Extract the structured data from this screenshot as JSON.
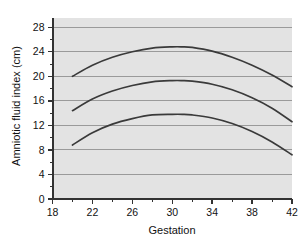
{
  "chart_data": {
    "type": "line",
    "title": "",
    "xlabel": "Gestation",
    "ylabel": "Amniotic fluid index (cm)",
    "xlim": [
      18,
      42
    ],
    "ylim": [
      0,
      29.5
    ],
    "xticks": [
      18,
      22,
      26,
      30,
      34,
      38,
      42
    ],
    "yticks": [
      0,
      4,
      8,
      12,
      16,
      20,
      24,
      28
    ],
    "xminor_step": 2,
    "yminor_step": 2,
    "grid": "horizontal",
    "legend": "none",
    "plot_background": "#e3e3e3",
    "gridline_color": "#9a9a9a",
    "line_color": "#3a3a3a",
    "axis_color": "#333333",
    "series": [
      {
        "name": "upper-percentile",
        "x": [
          20,
          22,
          24,
          26,
          28,
          30,
          31,
          32,
          34,
          36,
          38,
          40,
          42
        ],
        "values": [
          20.0,
          21.8,
          23.1,
          24.0,
          24.6,
          24.8,
          24.8,
          24.7,
          24.1,
          23.1,
          21.8,
          20.2,
          18.3
        ]
      },
      {
        "name": "median-percentile",
        "x": [
          20,
          22,
          24,
          26,
          28,
          30,
          31,
          32,
          34,
          36,
          38,
          40,
          42
        ],
        "values": [
          14.4,
          16.3,
          17.6,
          18.5,
          19.1,
          19.3,
          19.3,
          19.2,
          18.7,
          17.8,
          16.5,
          14.8,
          12.6
        ]
      },
      {
        "name": "lower-percentile",
        "x": [
          20,
          22,
          24,
          26,
          28,
          30,
          31,
          32,
          34,
          36,
          38,
          40,
          42
        ],
        "values": [
          8.8,
          10.8,
          12.2,
          13.1,
          13.7,
          13.8,
          13.8,
          13.7,
          13.2,
          12.3,
          11.0,
          9.3,
          7.2
        ]
      }
    ]
  },
  "axes": {
    "x_tick_labels": [
      "18",
      "22",
      "26",
      "30",
      "34",
      "38",
      "42"
    ],
    "y_tick_labels": [
      "0",
      "4",
      "8",
      "12",
      "16",
      "20",
      "24",
      "28"
    ],
    "x_title": "Gestation",
    "y_title": "Amniotic fluid index (cm)"
  }
}
